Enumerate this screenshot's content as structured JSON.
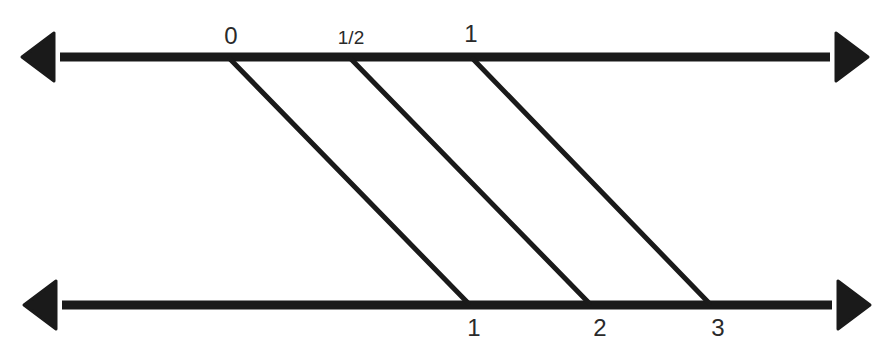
{
  "diagram": {
    "title": "",
    "line_color": "#1a1a1a",
    "top_line": {
      "y": 57,
      "x1": 22,
      "x2": 868,
      "labels": [
        {
          "text": "0",
          "x": 231,
          "y": 44,
          "size": 24
        },
        {
          "text": "1/2",
          "x": 351,
          "y": 44,
          "size": 19
        },
        {
          "text": "1",
          "x": 471,
          "y": 42,
          "size": 24
        }
      ]
    },
    "bottom_line": {
      "y": 305,
      "x1": 24,
      "x2": 870,
      "labels": [
        {
          "text": "1",
          "x": 474,
          "y": 336,
          "size": 24
        },
        {
          "text": "2",
          "x": 600,
          "y": 336,
          "size": 24
        },
        {
          "text": "3",
          "x": 718,
          "y": 336,
          "size": 24
        }
      ]
    },
    "connectors": [
      {
        "from_label": "0",
        "to_label": "1",
        "x1": 230,
        "y1": 59,
        "x2": 468,
        "y2": 303
      },
      {
        "from_label": "1/2",
        "to_label": "2",
        "x1": 351,
        "y1": 59,
        "x2": 589,
        "y2": 303
      },
      {
        "from_label": "1",
        "to_label": "3",
        "x1": 473,
        "y1": 59,
        "x2": 709,
        "y2": 303
      }
    ]
  }
}
